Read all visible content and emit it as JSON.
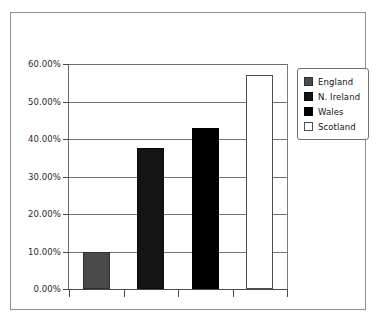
{
  "chart_data": {
    "type": "bar",
    "title": "",
    "subtitle": "",
    "xlabel": "",
    "ylabel": "",
    "categories": [
      "England",
      "N. Ireland",
      "Wales",
      "Scotland"
    ],
    "values": [
      10.0,
      37.7,
      43.0,
      57.0
    ],
    "value_labels": [
      "10.00%",
      "37.70%",
      "43.00%",
      "57.00%"
    ],
    "series": [
      {
        "name": "Percentage",
        "values": [
          10.0,
          37.7,
          43.0,
          57.0
        ]
      }
    ],
    "ylim": [
      0,
      60
    ],
    "ytick_values": [
      0,
      10,
      20,
      30,
      40,
      50,
      60
    ],
    "ytick_labels": [
      "0.00%",
      "10.00%",
      "20.00%",
      "30.00%",
      "40.00%",
      "50.00%",
      "60.00%"
    ],
    "xtick_labels": [],
    "grid": true,
    "grid_axis": "y",
    "legend_position": "right",
    "legend_entries": [
      {
        "label": "England",
        "color": "#4a4a4a",
        "swatch": "sw-england"
      },
      {
        "label": "N. Ireland",
        "color": "#141414",
        "swatch": "sw-nireland"
      },
      {
        "label": "Wales",
        "color": "#000000",
        "swatch": "sw-wales"
      },
      {
        "label": "Scotland",
        "color": "#ffffff",
        "swatch": "sw-scotland"
      }
    ],
    "bar_colors": [
      "#4a4a4a",
      "#141414",
      "#000000",
      "#ffffff"
    ],
    "annotations": []
  },
  "figure": {
    "frame_color": "#8d8d8d",
    "axis_color": "#4a4a4a",
    "gridline_color": "#757575",
    "background": "#ffffff",
    "cropped_top_text": ""
  }
}
